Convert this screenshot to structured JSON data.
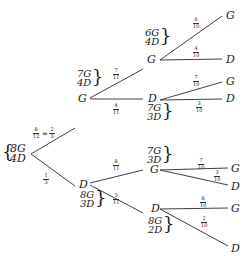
{
  "diagram": {
    "type": "probability-tree",
    "root": {
      "set": [
        "8G",
        "4D"
      ]
    },
    "level1": [
      {
        "node": "G",
        "prob": "8/12",
        "prob_simplified": "2/3",
        "set": [
          "7G",
          "4D"
        ]
      },
      {
        "node": "D",
        "prob": "1/3",
        "set": [
          "8G",
          "3D"
        ]
      }
    ],
    "level2": [
      {
        "parent": "G",
        "node": "G",
        "prob": "7/11",
        "set": [
          "6G",
          "4D"
        ]
      },
      {
        "parent": "G",
        "node": "D",
        "prob": "4/11",
        "set": [
          "7G",
          "3D"
        ]
      },
      {
        "parent": "D",
        "node": "G",
        "prob": "8/11",
        "set": [
          "7G",
          "3D"
        ]
      },
      {
        "parent": "D",
        "node": "D",
        "prob": "3/11",
        "set": [
          "8G",
          "2D"
        ]
      }
    ],
    "level3": [
      {
        "path": "GG",
        "node": "G",
        "prob": "6/10"
      },
      {
        "path": "GG",
        "node": "D",
        "prob": "4/10"
      },
      {
        "path": "GD",
        "node": "G",
        "prob": "7/10"
      },
      {
        "path": "GD",
        "node": "D",
        "prob": "3/10"
      },
      {
        "path": "DG",
        "node": "G",
        "prob": "7/10"
      },
      {
        "path": "DG",
        "node": "D",
        "prob": "3/10"
      },
      {
        "path": "DD",
        "node": "G",
        "prob": "8/10"
      },
      {
        "path": "DD",
        "node": "D",
        "prob": "2/10"
      }
    ]
  },
  "labels": {
    "root_top": "8G",
    "root_bottom": "4D",
    "eq": "=",
    "f_8_12_n": "8",
    "f_8_12_d": "12",
    "f_2_3_n": "2",
    "f_2_3_d": "3",
    "f_1_3_n": "1",
    "f_1_3_d": "3",
    "G1": "G",
    "D1": "D",
    "G1_set_top": "7G",
    "G1_set_bottom": "4D",
    "D1_set_top": "8G",
    "D1_set_bottom": "3D",
    "f_7_11_n": "7",
    "f_7_11_d": "11",
    "f_4_11_n": "4",
    "f_4_11_d": "11",
    "f_8_11_n": "8",
    "f_8_11_d": "11",
    "f_3_11_n": "3",
    "f_3_11_d": "11",
    "GG": "G",
    "GD": "D",
    "DG": "G",
    "DD": "D",
    "GG_set_top": "6G",
    "GG_set_bottom": "4D",
    "GD_set_top": "7G",
    "GD_set_bottom": "3D",
    "DG_set_top": "7G",
    "DG_set_bottom": "3D",
    "DD_set_top": "8G",
    "DD_set_bottom": "2D",
    "l1": "G",
    "l2": "D",
    "l3": "G",
    "l4": "D",
    "l5": "G",
    "l6": "D",
    "l7": "G",
    "l8": "D",
    "p1n": "6",
    "p2n": "4",
    "p3n": "7",
    "p4n": "3",
    "p5n": "7",
    "p6n": "3",
    "p7n": "8",
    "p8n": "2",
    "pd": "10"
  },
  "colors": {
    "ink": "#1a1a1a",
    "background": "#ffffff"
  }
}
